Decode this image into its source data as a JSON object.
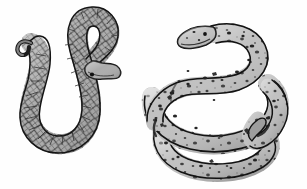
{
  "image": {
    "title": "Two Snakes",
    "medium": "pencil-and-ink line drawing",
    "background_color": "#fefefe",
    "width": 307,
    "height": 189,
    "subject_count": 2
  },
  "palette": {
    "background": "#fefefe",
    "outline": "#1a1a1a",
    "body_fill_left": "#a6a6a6",
    "body_fill_left_light": "#c2c2c2",
    "body_fill_left_dark": "#8d8d8d",
    "body_fill_right": "#b9b9b9",
    "body_fill_right_light": "#d2d2d2",
    "body_fill_right_shadow": "#939393",
    "marking_color": "#2a2a2a",
    "hatch_color": "#3c3c3c"
  },
  "subjects": [
    {
      "id": "snake-left",
      "label": "Left snake",
      "pattern": "diamond crosshatch scales",
      "pose": "S-curve with deep U bend",
      "head_position": "center-right, facing down-right",
      "tail_position": "upper-left, hooked",
      "fill": "#a6a6a6",
      "outline": "#1a1a1a"
    },
    {
      "id": "snake-right",
      "label": "Right snake",
      "pattern": "dark speckles and blotches",
      "pose": "coiled loop with overlapping body",
      "head_position": "upper-left, facing left",
      "tail_position": "lower-right, tucked under coil",
      "fill": "#b9b9b9",
      "outline": "#1a1a1a"
    }
  ],
  "annotations": {
    "caption": "",
    "labels": []
  }
}
